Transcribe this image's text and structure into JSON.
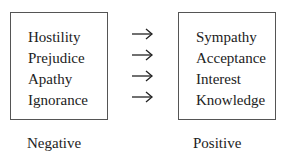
{
  "diagram": {
    "left_box": {
      "items": [
        "Hostility",
        "Prejudice",
        "Apathy",
        "Ignorance"
      ],
      "label": "Negative"
    },
    "right_box": {
      "items": [
        "Sympathy",
        "Acceptance",
        "Interest",
        "Knowledge"
      ],
      "label": "Positive"
    },
    "arrows": [
      "arrow-right",
      "arrow-right",
      "arrow-right",
      "arrow-right"
    ],
    "colors": {
      "text": "#222222",
      "border": "#555555",
      "background": "#ffffff"
    }
  }
}
